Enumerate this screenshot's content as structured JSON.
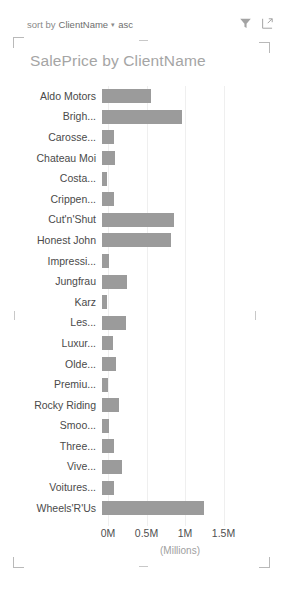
{
  "toolbar": {
    "sort_label": "sort by",
    "sort_field": "ClientName",
    "sort_caret": "▾",
    "sort_direction": "asc",
    "filter_icon": "filter-funnel-icon",
    "focus_icon": "focus-mode-icon"
  },
  "header": {
    "title": "SalePrice by ClientName"
  },
  "axis": {
    "caption": "(Millions)",
    "ticks": [
      "0M",
      "0.5M",
      "1M",
      "1.5M"
    ]
  },
  "chart_data": {
    "type": "bar",
    "orientation": "horizontal",
    "title": "SalePrice by ClientName",
    "xlabel": "(Millions)",
    "ylabel": "",
    "xlim": [
      0,
      1.5
    ],
    "grid": true,
    "legend": "none",
    "xticks": [
      0,
      0.5,
      1,
      1.5
    ],
    "xticklabels": [
      "0M",
      "0.5M",
      "1M",
      "1.5M"
    ],
    "categories": [
      "Aldo Motors",
      "Brigh...",
      "Carosse...",
      "Chateau Moi",
      "Costa...",
      "Crippen...",
      "Cut'n'Shut",
      "Honest John",
      "Impressi...",
      "Jungfrau",
      "Karz",
      "Les...",
      "Luxur...",
      "Olde...",
      "Premiu...",
      "Rocky Riding",
      "Smoo...",
      "Three...",
      "Vive...",
      "Voitures...",
      "Wheels'R'Us"
    ],
    "values": [
      0.63,
      1.04,
      0.15,
      0.17,
      0.07,
      0.15,
      0.93,
      0.89,
      0.09,
      0.33,
      0.07,
      0.31,
      0.14,
      0.18,
      0.08,
      0.22,
      0.09,
      0.16,
      0.26,
      0.15,
      1.32
    ],
    "series_name": "SalePrice",
    "bar_color": "#9b9b9b",
    "gridline_color": "#efefef"
  }
}
